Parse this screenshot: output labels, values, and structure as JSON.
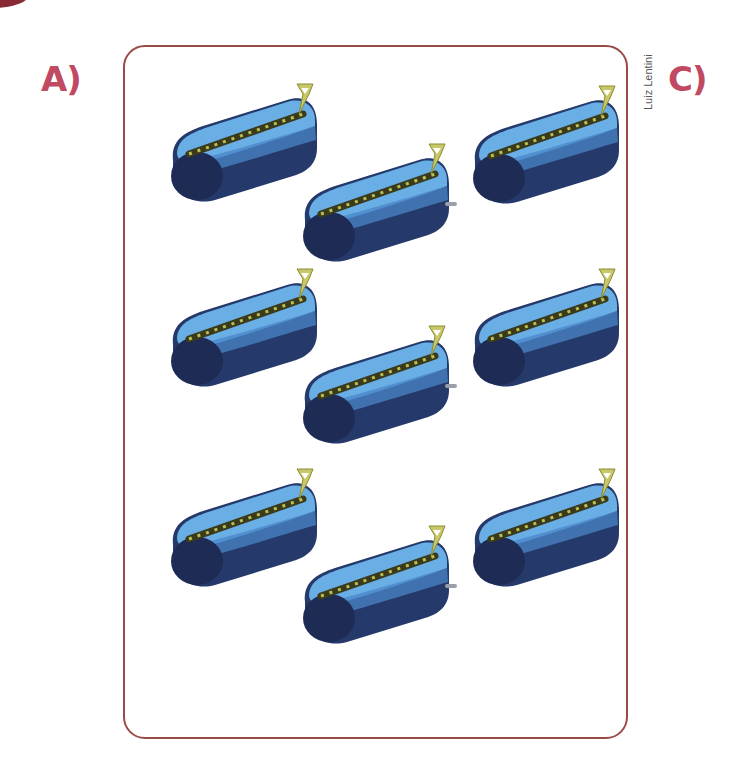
{
  "labels": {
    "left": "A)",
    "right": "C)",
    "color": "#c04a62"
  },
  "credit": "Luiz Lentini",
  "frame": {
    "border_color": "#9c4a48"
  },
  "palette": {
    "case_light": "#6aaee6",
    "case_mid": "#4a86c8",
    "case_dark": "#253a6a",
    "case_end": "#1e2c55",
    "zipper_track": "#3a3a1c",
    "zipper_teeth": "#b8c050",
    "zipper_pull": "#c8c86a",
    "tab": "#9aa0a8"
  },
  "cases": [
    {
      "id": "left-1",
      "column": "left",
      "row": 1,
      "x": 155,
      "y": 80,
      "has_tab": false
    },
    {
      "id": "left-2",
      "column": "left",
      "row": 2,
      "x": 155,
      "y": 265,
      "has_tab": false
    },
    {
      "id": "left-3",
      "column": "left",
      "row": 3,
      "x": 155,
      "y": 465,
      "has_tab": false
    },
    {
      "id": "middle-1",
      "column": "middle",
      "row": 1,
      "x": 287,
      "y": 140,
      "has_tab": true
    },
    {
      "id": "middle-2",
      "column": "middle",
      "row": 2,
      "x": 287,
      "y": 322,
      "has_tab": true
    },
    {
      "id": "middle-3",
      "column": "middle",
      "row": 3,
      "x": 287,
      "y": 522,
      "has_tab": true
    },
    {
      "id": "right-1",
      "column": "right",
      "row": 1,
      "x": 457,
      "y": 82,
      "has_tab": false
    },
    {
      "id": "right-2",
      "column": "right",
      "row": 2,
      "x": 457,
      "y": 265,
      "has_tab": false
    },
    {
      "id": "right-3",
      "column": "right",
      "row": 3,
      "x": 457,
      "y": 465,
      "has_tab": false
    }
  ]
}
